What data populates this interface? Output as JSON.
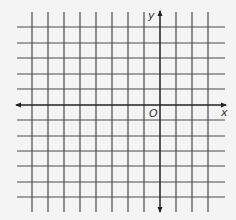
{
  "diagram": {
    "type": "coordinate-grid",
    "colors": {
      "background": "#f4f4f4",
      "grid": "#4a4a4a",
      "axis": "#222222",
      "label": "#333333"
    },
    "grid": {
      "columns_x": [
        32,
        48,
        64,
        80,
        96,
        112,
        128,
        144,
        176,
        192,
        208
      ],
      "rows_y": [
        27,
        43,
        58,
        74,
        89,
        120,
        136,
        151,
        166,
        182,
        197
      ],
      "vertical_extent": [
        12,
        212
      ],
      "horizontal_extent": [
        17,
        225
      ]
    },
    "axes": {
      "x_axis": {
        "y": 105,
        "from": 16,
        "to": 226,
        "label": "x"
      },
      "y_axis": {
        "x": 160,
        "from": 11,
        "to": 212,
        "label": "y"
      },
      "origin_label": "O"
    }
  }
}
